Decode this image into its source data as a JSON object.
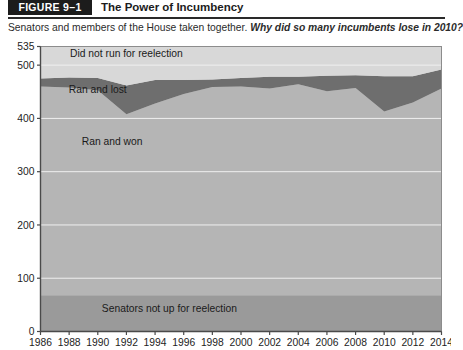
{
  "figure": {
    "badge": "FIGURE 9–1",
    "title": "The Power of Incumbency",
    "subtitle_lead": "Senators and members of the House taken together.",
    "subtitle_question": "Why did so many incumbents lose in 2010?"
  },
  "colors": {
    "senators_not_up": "#9a9a9a",
    "ran_and_won": "#b5b5b5",
    "ran_and_lost": "#6e6e6e",
    "did_not_run": "#d8d8d8",
    "plot_background": "#d8d8d8",
    "gridline": "#f0f0f0",
    "axis": "#4a4a4a",
    "header_bar": "#1c1c1c"
  },
  "chart_data": {
    "type": "area",
    "title": "The Power of Incumbency",
    "xlabel": "",
    "ylabel": "",
    "stacked": true,
    "grid": true,
    "legend_position": "inline-labels",
    "xlim": [
      1986,
      2014
    ],
    "ylim": [
      0,
      535
    ],
    "yticks": [
      0,
      100,
      200,
      300,
      400,
      500,
      535
    ],
    "ytick_labels": [
      "0",
      "100",
      "200",
      "300",
      "400",
      "500",
      "535"
    ],
    "x": [
      1986,
      1988,
      1990,
      1992,
      1994,
      1996,
      1998,
      2000,
      2002,
      2004,
      2006,
      2008,
      2010,
      2012,
      2014
    ],
    "xtick_labels": [
      "1986",
      "1988",
      "1990",
      "1992",
      "1994",
      "1996",
      "1998",
      "2000",
      "2002",
      "2004",
      "2006",
      "2008",
      "2010",
      "2012",
      "2014"
    ],
    "series": [
      {
        "name": "Senators not up for reelection",
        "color": "#9a9a9a",
        "values": [
          68,
          68,
          68,
          68,
          68,
          68,
          68,
          68,
          68,
          68,
          68,
          68,
          68,
          68,
          68
        ]
      },
      {
        "name": "Ran and won",
        "color": "#b5b5b5",
        "values": [
          392,
          390,
          385,
          340,
          360,
          378,
          391,
          392,
          388,
          396,
          383,
          389,
          345,
          362,
          388
        ]
      },
      {
        "name": "Ran and lost",
        "color": "#6e6e6e",
        "values": [
          15,
          19,
          23,
          54,
          44,
          26,
          14,
          16,
          22,
          14,
          29,
          24,
          66,
          49,
          36
        ]
      },
      {
        "name": "Did not run for reelection",
        "color": "#d8d8d8",
        "values": [
          60,
          58,
          59,
          73,
          63,
          63,
          62,
          59,
          57,
          57,
          55,
          54,
          56,
          56,
          43
        ]
      }
    ],
    "annotations": [
      {
        "text": "Did not run for reelection",
        "x": 1992,
        "y": 515
      },
      {
        "text": "Ran and lost",
        "x": 1990,
        "y": 447
      },
      {
        "text": "Ran and won",
        "x": 1991,
        "y": 350
      },
      {
        "text": "Senators not up for reelection",
        "x": 1995,
        "y": 36
      }
    ]
  }
}
